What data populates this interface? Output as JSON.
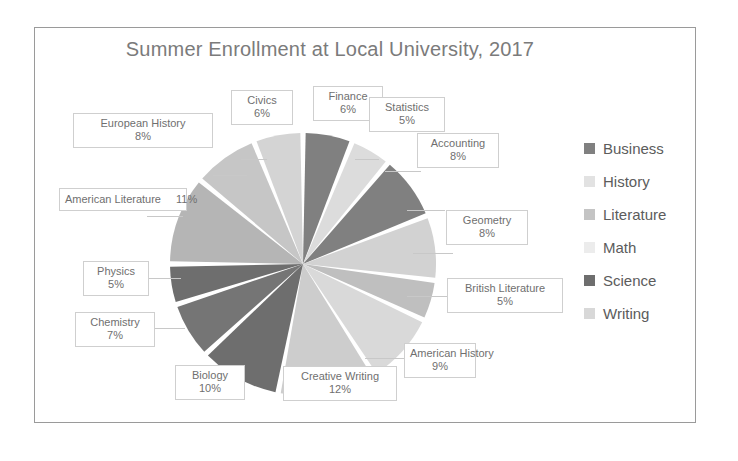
{
  "chart_data": {
    "type": "pie",
    "title": "Summer Enrollment at Local University, 2017",
    "categories": [
      "Finance",
      "Statistics",
      "Accounting",
      "Geometry",
      "British Literature",
      "American History",
      "Creative Writing",
      "Biology",
      "Chemistry",
      "Physics",
      "American Literature",
      "European History",
      "Civics"
    ],
    "values": [
      6,
      5,
      8,
      8,
      5,
      9,
      12,
      10,
      7,
      5,
      11,
      8,
      6
    ],
    "value_suffix": "%",
    "slices": [
      {
        "label": "Finance",
        "pct": "6%",
        "value": 6,
        "group": "Business",
        "color": "#808080"
      },
      {
        "label": "Statistics",
        "pct": "5%",
        "value": 5,
        "group": "Math",
        "color": "#dcdcdc"
      },
      {
        "label": "Accounting",
        "pct": "8%",
        "value": 8,
        "group": "Business",
        "color": "#808080"
      },
      {
        "label": "Geometry",
        "pct": "8%",
        "value": 8,
        "group": "Math",
        "color": "#d2d2d2"
      },
      {
        "label": "British Literature",
        "pct": "5%",
        "value": 5,
        "group": "Literature",
        "color": "#bfbfbf"
      },
      {
        "label": "American History",
        "pct": "9%",
        "value": 9,
        "group": "History",
        "color": "#d9d9d9"
      },
      {
        "label": "Creative Writing",
        "pct": "12%",
        "value": 12,
        "group": "Writing",
        "color": "#cdcdcd"
      },
      {
        "label": "Biology",
        "pct": "10%",
        "value": 10,
        "group": "Science",
        "color": "#6e6e6e"
      },
      {
        "label": "Chemistry",
        "pct": "7%",
        "value": 7,
        "group": "Science",
        "color": "#757575"
      },
      {
        "label": "Physics",
        "pct": "5%",
        "value": 5,
        "group": "Science",
        "color": "#6e6e6e"
      },
      {
        "label": "American Literature",
        "pct": "11%",
        "value": 11,
        "group": "Literature",
        "color": "#b5b5b5"
      },
      {
        "label": "European History",
        "pct": "8%",
        "value": 8,
        "group": "History",
        "color": "#c6c6c6"
      },
      {
        "label": "Civics",
        "pct": "6%",
        "value": 6,
        "group": "History",
        "color": "#d4d4d4"
      }
    ],
    "legend": {
      "position": "right",
      "entries": [
        {
          "label": "Business",
          "color": "#808080"
        },
        {
          "label": "History",
          "color": "#e2e2e2"
        },
        {
          "label": "Literature",
          "color": "#c4c4c4"
        },
        {
          "label": "Math",
          "color": "#ececec"
        },
        {
          "label": "Science",
          "color": "#6e6e6e"
        },
        {
          "label": "Writing",
          "color": "#d8d8d8"
        }
      ]
    }
  }
}
